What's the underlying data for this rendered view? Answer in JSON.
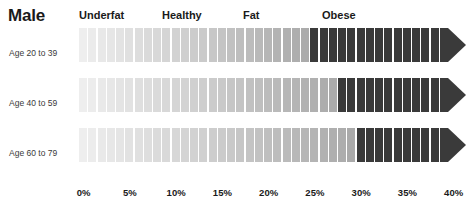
{
  "header": {
    "title": "Male"
  },
  "categories_header": [
    {
      "label": "Underfat",
      "x": 79
    },
    {
      "label": "Healthy",
      "x": 162
    },
    {
      "label": "Fat",
      "x": 243
    },
    {
      "label": "Obese",
      "x": 322
    }
  ],
  "axis": {
    "ticks": [
      "0%",
      "5%",
      "10%",
      "15%",
      "20%",
      "25%",
      "30%",
      "35%",
      "40%"
    ],
    "tick_values": [
      0,
      5,
      10,
      15,
      20,
      25,
      30,
      35,
      40
    ],
    "min": 0,
    "max": 40,
    "x_start": 79,
    "px_per_percent": 9.25
  },
  "rows": [
    {
      "label": "Age 20 to 39",
      "y": 28,
      "obese_start": 25
    },
    {
      "label": "Age 40 to 59",
      "y": 78,
      "obese_start": 28
    },
    {
      "label": "Age 60 to 79",
      "y": 128,
      "obese_start": 30
    }
  ],
  "colors": {
    "light_start": "#eeeeee",
    "light_end": "#a8a8a8",
    "obese": "#3a3a3a",
    "text": "#1a1a1a",
    "row_label": "#3a3a3a",
    "background": "#ffffff",
    "gap": "#ffffff"
  },
  "chart_data": {
    "type": "bar",
    "title": "Male",
    "xlabel": "",
    "ylabel": "",
    "xlim": [
      0,
      40
    ],
    "grid": false,
    "legend": "top",
    "legend_entries": [
      "Underfat",
      "Healthy",
      "Fat",
      "Obese"
    ],
    "categories": [
      "Age 20 to 39",
      "Age 40 to 59",
      "Age 60 to 79"
    ],
    "series": [
      {
        "name": "Underfat",
        "values": [
          8,
          11,
          13
        ]
      },
      {
        "name": "Healthy",
        "values": [
          11,
          11,
          11
        ]
      },
      {
        "name": "Fat",
        "values": [
          6,
          6,
          6
        ]
      },
      {
        "name": "Obese",
        "values": [
          15,
          12,
          10
        ]
      }
    ],
    "annotations": [
      "Body fat percentage ranges for males by age group",
      "Obese threshold: 25% (Age 20 to 39), 28% (Age 40 to 59), 30% (Age 60 to 79)",
      "Bars are segmented into 1% increments shaded from light to dark"
    ]
  }
}
